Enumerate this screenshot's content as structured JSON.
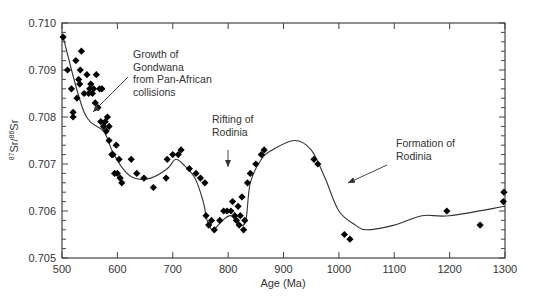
{
  "chart_data": {
    "type": "scatter",
    "title": "",
    "xlabel": "Age (Ma)",
    "ylabel": "87Sr/86Sr",
    "ylabel_parts": {
      "sup1": "87",
      "base1": "Sr/",
      "sup2": "86",
      "base2": "Sr"
    },
    "xlim": [
      500,
      1300
    ],
    "ylim": [
      0.705,
      0.71
    ],
    "x_ticks": [
      500,
      600,
      700,
      800,
      900,
      1000,
      1100,
      1200,
      1300
    ],
    "x_tick_labels": [
      "500",
      "600",
      "700",
      "800",
      "900",
      "1000",
      "1100",
      "1200",
      "1300"
    ],
    "y_ticks": [
      0.705,
      0.706,
      0.707,
      0.708,
      0.709,
      0.71
    ],
    "y_tick_labels": [
      "0.705",
      "0.706",
      "0.707",
      "0.708",
      "0.709",
      "0.710"
    ],
    "y_minor_step": 0.0002,
    "grid": false,
    "legend": null,
    "series": [
      {
        "name": "Seawater Sr isotope measurements",
        "type": "scatter",
        "marker": "diamond",
        "color": "#000000",
        "points": [
          [
            502,
            0.7097
          ],
          [
            510,
            0.709
          ],
          [
            517,
            0.7086
          ],
          [
            520,
            0.7081
          ],
          [
            520,
            0.708
          ],
          [
            525,
            0.7092
          ],
          [
            527,
            0.7084
          ],
          [
            530,
            0.7088
          ],
          [
            532,
            0.7087
          ],
          [
            533,
            0.709
          ],
          [
            535,
            0.7094
          ],
          [
            540,
            0.7085
          ],
          [
            545,
            0.7089
          ],
          [
            548,
            0.7085
          ],
          [
            550,
            0.7086
          ],
          [
            552,
            0.7087
          ],
          [
            555,
            0.7085
          ],
          [
            557,
            0.7086
          ],
          [
            560,
            0.7083
          ],
          [
            562,
            0.7089
          ],
          [
            565,
            0.7082
          ],
          [
            568,
            0.7086
          ],
          [
            570,
            0.7079
          ],
          [
            572,
            0.7086
          ],
          [
            575,
            0.7078
          ],
          [
            578,
            0.7079
          ],
          [
            580,
            0.7077
          ],
          [
            582,
            0.708
          ],
          [
            585,
            0.7075
          ],
          [
            585,
            0.7078
          ],
          [
            590,
            0.7072
          ],
          [
            592,
            0.7072
          ],
          [
            595,
            0.7068
          ],
          [
            598,
            0.7074
          ],
          [
            600,
            0.7068
          ],
          [
            603,
            0.7071
          ],
          [
            605,
            0.7067
          ],
          [
            608,
            0.7066
          ],
          [
            625,
            0.7071
          ],
          [
            635,
            0.7068
          ],
          [
            648,
            0.7067
          ],
          [
            665,
            0.7065
          ],
          [
            688,
            0.7067
          ],
          [
            690,
            0.7071
          ],
          [
            700,
            0.7072
          ],
          [
            710,
            0.7072
          ],
          [
            715,
            0.7073
          ],
          [
            730,
            0.7069
          ],
          [
            742,
            0.7068
          ],
          [
            750,
            0.7067
          ],
          [
            758,
            0.7066
          ],
          [
            760,
            0.7059
          ],
          [
            765,
            0.7057
          ],
          [
            770,
            0.7058
          ],
          [
            775,
            0.7056
          ],
          [
            785,
            0.7058
          ],
          [
            792,
            0.706
          ],
          [
            798,
            0.706
          ],
          [
            805,
            0.706
          ],
          [
            808,
            0.7062
          ],
          [
            812,
            0.7059
          ],
          [
            815,
            0.7058
          ],
          [
            818,
            0.7061
          ],
          [
            820,
            0.7057
          ],
          [
            822,
            0.7059
          ],
          [
            825,
            0.7063
          ],
          [
            828,
            0.7056
          ],
          [
            830,
            0.7058
          ],
          [
            835,
            0.7066
          ],
          [
            840,
            0.7068
          ],
          [
            850,
            0.707
          ],
          [
            860,
            0.7072
          ],
          [
            865,
            0.7073
          ],
          [
            955,
            0.7071
          ],
          [
            962,
            0.707
          ],
          [
            1010,
            0.7055
          ],
          [
            1020,
            0.7054
          ],
          [
            1195,
            0.706
          ],
          [
            1255,
            0.7057
          ],
          [
            1297,
            0.7062
          ],
          [
            1298,
            0.7064
          ]
        ]
      },
      {
        "name": "Trend curve",
        "type": "line",
        "color": "#333333",
        "points": [
          [
            502,
            0.7097
          ],
          [
            540,
            0.7081
          ],
          [
            575,
            0.7077
          ],
          [
            590,
            0.7073
          ],
          [
            610,
            0.7069
          ],
          [
            630,
            0.7067
          ],
          [
            660,
            0.7067
          ],
          [
            690,
            0.7069
          ],
          [
            705,
            0.7071
          ],
          [
            718,
            0.707
          ],
          [
            740,
            0.7067
          ],
          [
            755,
            0.7062
          ],
          [
            762,
            0.7058
          ],
          [
            772,
            0.7056
          ],
          [
            790,
            0.7058
          ],
          [
            805,
            0.7059
          ],
          [
            820,
            0.7057
          ],
          [
            832,
            0.7058
          ],
          [
            840,
            0.7066
          ],
          [
            860,
            0.7071
          ],
          [
            880,
            0.7073
          ],
          [
            920,
            0.7075
          ],
          [
            950,
            0.7073
          ],
          [
            975,
            0.7067
          ],
          [
            1000,
            0.706
          ],
          [
            1030,
            0.7057
          ],
          [
            1050,
            0.7056
          ],
          [
            1100,
            0.7057
          ],
          [
            1150,
            0.7059
          ],
          [
            1200,
            0.7059
          ],
          [
            1300,
            0.7061
          ]
        ]
      }
    ],
    "annotations": [
      {
        "text_lines": [
          "Growth of",
          "Gondwana",
          "from Pan-African",
          "collisions"
        ],
        "label_x": 133,
        "label_y": 58,
        "arrow_from": [
          128,
          77
        ],
        "arrow_to": [
          93,
          112
        ]
      },
      {
        "text_lines": [
          "Rifting of",
          "Rodinia"
        ],
        "label_x": 212,
        "label_y": 123,
        "arrow_from": [
          228,
          150
        ],
        "arrow_to": [
          228,
          167
        ]
      },
      {
        "text_lines": [
          "Formation of",
          "Rodinia"
        ],
        "label_x": 396,
        "label_y": 147,
        "arrow_from": [
          387,
          165
        ],
        "arrow_to": [
          348,
          183
        ]
      }
    ]
  },
  "caption": "Figure caption (partially visible, cut off at bottom edge)"
}
